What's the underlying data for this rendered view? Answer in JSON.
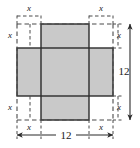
{
  "figure": {
    "sheet": {
      "side_label": "12",
      "side_value": 12,
      "shape": "square",
      "outline_style": "dashed"
    },
    "cutout": {
      "label": "x",
      "count": 4,
      "shape": "square",
      "fill": "#ffffff"
    },
    "cross": {
      "fill": "#c9c9c9",
      "stroke": "#2b2b2b",
      "description": "plus-shaped net formed by the vertical and horizontal bands that remain"
    },
    "colors": {
      "gray_fill": "#c9c9c9",
      "solid_line": "#2b2b2b",
      "dashed_line": "#4a4a4a",
      "text": "#1a1a1a",
      "background": "#ffffff"
    },
    "labels": {
      "x_top_left": "x",
      "x_top_right": "x",
      "x_left_upper": "x",
      "x_right_upper": "x",
      "x_left_lower": "x",
      "x_right_lower": "x",
      "x_bottom_left": "x",
      "x_bottom_right": "x",
      "dim_right": "12",
      "dim_bottom": "12"
    }
  }
}
